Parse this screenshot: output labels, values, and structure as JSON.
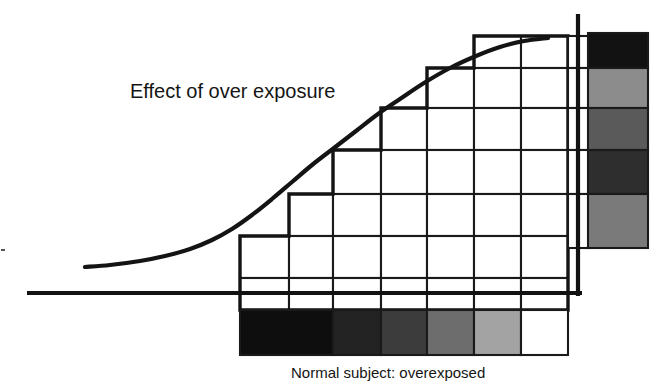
{
  "figure": {
    "title_label": "Effect of over exposure",
    "caption_label": "Normal subject: overexposed",
    "background_color": "#ffffff",
    "ink_color": "#141414"
  },
  "chart_data": {
    "type": "line",
    "title": "Effect of over exposure",
    "subtitle": "Normal subject: overexposed",
    "xlabel": "",
    "ylabel": "",
    "grid": true,
    "legend_position": "none",
    "annotations": [
      {
        "text": "Effect of over exposure",
        "x": 130,
        "y": 92
      },
      {
        "text": "Normal subject: overexposed",
        "x": 291,
        "y": 372
      }
    ],
    "axes": {
      "baseline_y": 293,
      "baseline_x_start": 27,
      "baseline_x_end": 582,
      "vertical_axis_x": 578,
      "vertical_axis_y_top": 14,
      "vertical_axis_y_bottom": 293
    },
    "series": [
      {
        "name": "characteristic-curve",
        "x": [
          85,
          110,
          140,
          165,
          190,
          212,
          232,
          252,
          272,
          292,
          312,
          334,
          356,
          378,
          400,
          424,
          450,
          476,
          500,
          524,
          548
        ],
        "y": [
          267,
          265,
          261,
          256,
          249,
          240,
          229,
          215,
          199,
          182,
          165,
          148,
          131,
          114,
          99,
          83,
          68,
          56,
          47,
          41,
          38
        ]
      }
    ],
    "exposure_steps": {
      "count": 7,
      "column_edges": [
        240,
        289,
        333,
        381,
        427,
        474,
        521,
        568
      ],
      "row_edges": [
        36,
        68,
        108,
        150,
        194,
        236,
        278,
        293,
        310,
        355
      ]
    },
    "subject_scale": {
      "label": "Normal subject: overexposed",
      "orientation": "horizontal",
      "position": "bottom",
      "x_start": 240,
      "x_end": 568,
      "y_top": 310,
      "y_bottom": 355,
      "cells": [
        {
          "index": 0,
          "color": "#0e0e0e",
          "x": 240,
          "width": 93
        },
        {
          "index": 1,
          "color": "#232323",
          "x": 333,
          "width": 48
        },
        {
          "index": 2,
          "color": "#3c3c3c",
          "x": 381,
          "width": 46
        },
        {
          "index": 3,
          "color": "#6d6d6d",
          "x": 427,
          "width": 47
        },
        {
          "index": 4,
          "color": "#a3a3a3",
          "x": 474,
          "width": 47
        },
        {
          "index": 5,
          "color": "#ffffff",
          "x": 521,
          "width": 47
        }
      ]
    },
    "density_scale": {
      "label": "",
      "orientation": "vertical",
      "position": "right",
      "x_left": 588,
      "x_right": 648,
      "y_start": 33,
      "y_end": 248,
      "cells": [
        {
          "index": 0,
          "color": "#121212",
          "y": 33,
          "height": 35
        },
        {
          "index": 1,
          "color": "#8c8c8c",
          "y": 68,
          "height": 40
        },
        {
          "index": 2,
          "color": "#5a5a5a",
          "y": 108,
          "height": 42
        },
        {
          "index": 3,
          "color": "#2e2e2e",
          "y": 150,
          "height": 44
        },
        {
          "index": 4,
          "color": "#7a7a7a",
          "y": 194,
          "height": 54
        }
      ]
    }
  }
}
